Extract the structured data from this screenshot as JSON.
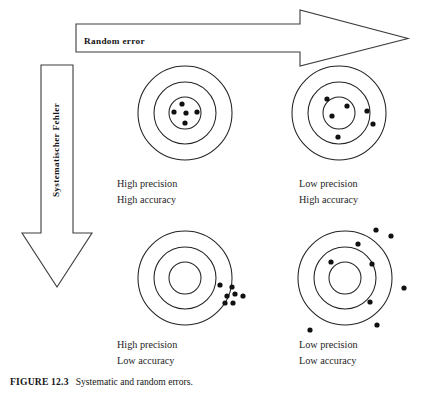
{
  "figure": {
    "caption_label": "FIGURE 12.3",
    "caption_text": "Systematic and random errors.",
    "horizontal_arrow_label": "Random error",
    "vertical_arrow_label": "Systematischer Fehler",
    "stroke_color": "#232323",
    "dot_color": "#111111",
    "background_color": "#ffffff"
  },
  "targets": [
    {
      "id": "top-left",
      "precision_label": "High precision",
      "accuracy_label": "High accuracy",
      "center": [
        185,
        113
      ],
      "radii": [
        47,
        31,
        16
      ],
      "dot_radius": 2.6,
      "dots": [
        [
          182,
          104
        ],
        [
          174,
          112
        ],
        [
          186,
          113
        ],
        [
          197,
          112
        ],
        [
          185,
          123
        ]
      ]
    },
    {
      "id": "top-right",
      "precision_label": "Low precision",
      "accuracy_label": "High accuracy",
      "center": [
        339,
        113
      ],
      "radii": [
        47,
        31,
        16
      ],
      "dot_radius": 2.6,
      "dots": [
        [
          327,
          99
        ],
        [
          347,
          106
        ],
        [
          332,
          116
        ],
        [
          367,
          111
        ],
        [
          373,
          124
        ],
        [
          338,
          137
        ]
      ]
    },
    {
      "id": "bottom-left",
      "precision_label": "High precision",
      "accuracy_label": "Low accuracy",
      "center": [
        185,
        278
      ],
      "radii": [
        47,
        31,
        16
      ],
      "dot_radius": 2.6,
      "dots": [
        [
          220,
          285
        ],
        [
          232,
          287
        ],
        [
          227,
          296
        ],
        [
          235,
          294
        ],
        [
          225,
          303
        ],
        [
          233,
          303
        ],
        [
          243,
          296
        ]
      ]
    },
    {
      "id": "bottom-right",
      "precision_label": "Low precision",
      "accuracy_label": "Low accuracy",
      "center": [
        345,
        278
      ],
      "radii": [
        47,
        31,
        16
      ],
      "dot_radius": 2.6,
      "dots": [
        [
          376,
          230
        ],
        [
          358,
          244
        ],
        [
          391,
          236
        ],
        [
          331,
          262
        ],
        [
          372,
          264
        ],
        [
          404,
          288
        ],
        [
          370,
          302
        ],
        [
          377,
          325
        ],
        [
          310,
          330
        ]
      ]
    }
  ],
  "panel_labels": [
    {
      "id": "top-left-label",
      "left": 117,
      "top": 176,
      "precision": "High precision",
      "accuracy": "High accuracy"
    },
    {
      "id": "top-right-label",
      "left": 299,
      "top": 176,
      "precision": "Low precision",
      "accuracy": "High accuracy"
    },
    {
      "id": "bottom-left-label",
      "left": 117,
      "top": 337,
      "precision": "High precision",
      "accuracy": "Low accuracy"
    },
    {
      "id": "bottom-right-label",
      "left": 299,
      "top": 337,
      "precision": "Low precision",
      "accuracy": "Low accuracy"
    }
  ],
  "arrows": {
    "horizontal": {
      "points": "76,24 300,24 300,10 408,38.5 300,66 300,52 76,52",
      "label_x": 84,
      "label_y": 42
    },
    "vertical": {
      "points": "41,65 73,65 73,233 92,233 57,287 22,233 41,233",
      "label_x": 57,
      "label_y": 150
    }
  }
}
